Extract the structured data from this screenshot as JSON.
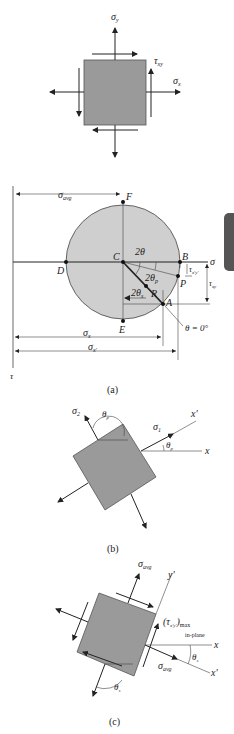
{
  "figure": {
    "panel_top": {
      "labels": {
        "sigma_y": "σ",
        "sigma_y_sub": "y",
        "tau_xy": "τ",
        "tau_xy_sub": "xy",
        "sigma_x": "σ",
        "sigma_x_sub": "x"
      }
    },
    "panel_a": {
      "caption": "(a)",
      "points": {
        "C": "C",
        "D": "D",
        "B": "B",
        "F": "F",
        "E": "E",
        "A": "A",
        "P": "P",
        "R": "R"
      },
      "labels": {
        "sigma_avg": "σ",
        "sigma_avg_sub": "avg",
        "sigma_axis": "σ",
        "tau_axis": "τ",
        "two_theta": "2θ",
        "two_theta_p1": "2θ",
        "two_theta_p1_sub": "p",
        "two_theta_s1": "2θ",
        "two_theta_s1_sub": "s",
        "tau_xpyp": "τ",
        "tau_xpyp_sub": "x'y'",
        "tau_xy": "τ",
        "tau_xy_sub": "xy",
        "theta_zero": "θ = 0°",
        "sigma_x": "σ",
        "sigma_x_sub": "x",
        "sigma_xp": "σ",
        "sigma_xp_sub": "x'"
      }
    },
    "panel_b": {
      "caption": "(b)",
      "labels": {
        "sigma_2": "σ",
        "sigma_2_sub": "2",
        "sigma_1": "σ",
        "sigma_1_sub": "1",
        "theta_p2": "θ",
        "theta_p2_sub": "p",
        "theta_p1": "θ",
        "theta_p1_sub": "p",
        "x_prime": "x'",
        "x": "x"
      }
    },
    "panel_c": {
      "caption": "(c)",
      "labels": {
        "sigma_avg_top": "σ",
        "sigma_avg_top_sub": "avg",
        "y_prime": "y'",
        "tau_max": "(τ",
        "tau_max_sub": "x'y'",
        "tau_max_close": ")",
        "tau_max_sub2": "max",
        "in_plane": "in-plane",
        "x": "x",
        "theta_s1": "θ",
        "theta_s1_sub": "s",
        "sigma_avg_right": "σ",
        "sigma_avg_right_sub": "avg",
        "x_prime": "x'",
        "theta_s1_lower": "θ",
        "theta_s1_lower_sub": "s"
      }
    },
    "colors": {
      "fill_gray": "#9a9a9a",
      "circle_fill": "#cfcfcf",
      "line": "#222222",
      "tab": "#555555"
    }
  }
}
